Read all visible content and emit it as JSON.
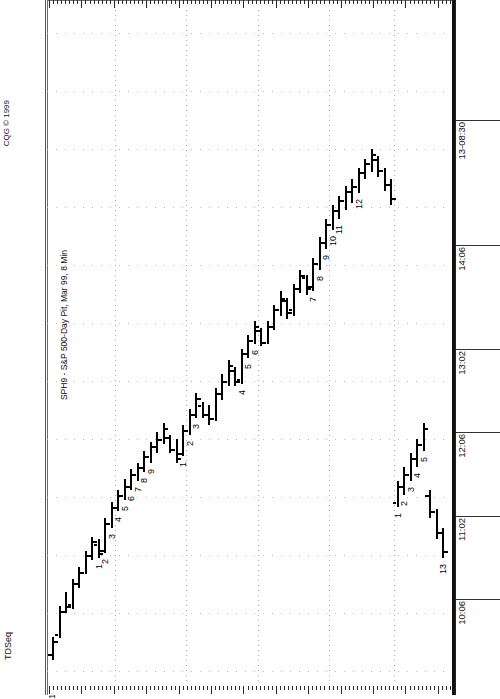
{
  "window": {
    "copyright": "CQG © 1999",
    "study_label": "TDSeq",
    "title": "SPH9 - S&P 500-Day Pit, Mar 99, 8 Min"
  },
  "axes": {
    "price_labels": [
      "126500",
      "126000",
      "125500",
      "125000",
      "124500",
      "124000",
      "123500",
      "123000",
      "122500",
      "122000",
      "121500",
      "121000"
    ],
    "time_labels": [
      "13-08:30",
      "14:06",
      "13:02",
      "12:06",
      "11:02",
      "10:06"
    ]
  },
  "chart_data": {
    "type": "bar",
    "subtype": "ohlc-bar-chart-rotated",
    "title": "SPH9 - S&P 500-Day Pit, Mar 99, 8 Min",
    "study": "TDSeq",
    "copyright": "CQG © 1999",
    "xlabel": "Time",
    "ylabel": "Price",
    "ylim": [
      121000,
      126500
    ],
    "price_ticks": [
      126500,
      126000,
      125500,
      125000,
      124500,
      124000,
      123500,
      123000,
      122500,
      122000,
      121500,
      121000
    ],
    "time_ticks": [
      "10:06",
      "11:02",
      "12:06",
      "13:02",
      "14:06",
      "13-08:30"
    ],
    "grid": true,
    "legend": "none",
    "orientation": "time axis runs left-to-right across screenshot; price axis runs top-to-bottom",
    "annotations": {
      "buy_setup_lower_left": [
        "1",
        "2",
        "3",
        "4",
        "5",
        "6",
        "7",
        "8",
        "9"
      ],
      "sell_setup_midday": [
        "1",
        "2",
        "3",
        "4",
        "5",
        "6",
        "7",
        "8",
        "9",
        "10",
        "11",
        "12"
      ],
      "countdown_next_session": [
        "1",
        "2",
        "3",
        "4",
        "5"
      ],
      "countdown_thirteen": "13"
    },
    "bars": [
      {
        "t": 0,
        "high": 121300,
        "low": 121100,
        "open": 121150,
        "close": 121260
      },
      {
        "t": 1,
        "high": 121560,
        "low": 121290,
        "open": 121320,
        "close": 121520
      },
      {
        "t": 2,
        "high": 121680,
        "low": 121500,
        "open": 121520,
        "close": 121560
      },
      {
        "t": 3,
        "high": 121800,
        "low": 121540,
        "open": 121580,
        "close": 121760
      },
      {
        "t": 4,
        "high": 121900,
        "low": 121720,
        "open": 121760,
        "close": 121860
      },
      {
        "t": 5,
        "high": 122040,
        "low": 121840,
        "open": 121860,
        "close": 122000
      },
      {
        "t": 6,
        "high": 122160,
        "low": 121960,
        "open": 122000,
        "close": 122120
      },
      {
        "t": 7,
        "high": 122140,
        "low": 121980,
        "open": 122100,
        "close": 122020,
        "count": "1"
      },
      {
        "t": 8,
        "high": 122320,
        "low": 122020,
        "open": 122050,
        "close": 122280,
        "count": "2"
      },
      {
        "t": 9,
        "high": 122460,
        "low": 122240,
        "open": 122280,
        "close": 122420,
        "count": "3"
      },
      {
        "t": 10,
        "high": 122560,
        "low": 122380,
        "open": 122420,
        "close": 122520,
        "count": "4"
      },
      {
        "t": 11,
        "high": 122660,
        "low": 122480,
        "open": 122520,
        "close": 122600,
        "count": "5"
      },
      {
        "t": 12,
        "high": 122740,
        "low": 122560,
        "open": 122600,
        "close": 122700,
        "count": "6"
      },
      {
        "t": 13,
        "high": 122800,
        "low": 122640,
        "open": 122700,
        "close": 122760,
        "count": "7"
      },
      {
        "t": 14,
        "high": 122900,
        "low": 122720,
        "open": 122760,
        "close": 122860,
        "count": "8"
      },
      {
        "t": 15,
        "high": 122980,
        "low": 122800,
        "open": 122860,
        "close": 122940,
        "count": "9"
      },
      {
        "t": 16,
        "high": 123060,
        "low": 122880,
        "open": 122940,
        "close": 123000
      },
      {
        "t": 17,
        "high": 123140,
        "low": 122960,
        "open": 123000,
        "close": 123100
      },
      {
        "t": 18,
        "high": 123040,
        "low": 122880,
        "open": 123020,
        "close": 122920
      },
      {
        "t": 19,
        "high": 123000,
        "low": 122800,
        "open": 122920,
        "close": 122840
      },
      {
        "t": 20,
        "high": 123120,
        "low": 122860,
        "open": 122880,
        "close": 123080,
        "count": "1"
      },
      {
        "t": 21,
        "high": 123260,
        "low": 123040,
        "open": 123080,
        "close": 123220,
        "count": "2"
      },
      {
        "t": 22,
        "high": 123400,
        "low": 123180,
        "open": 123220,
        "close": 123360,
        "count": "3"
      },
      {
        "t": 23,
        "high": 123320,
        "low": 123180,
        "open": 123300,
        "close": 123220
      },
      {
        "t": 24,
        "high": 123300,
        "low": 123120,
        "open": 123220,
        "close": 123180
      },
      {
        "t": 25,
        "high": 123440,
        "low": 123160,
        "open": 123180,
        "close": 123400
      },
      {
        "t": 26,
        "high": 123560,
        "low": 123340,
        "open": 123400,
        "close": 123500
      },
      {
        "t": 27,
        "high": 123680,
        "low": 123460,
        "open": 123500,
        "close": 123640
      },
      {
        "t": 28,
        "high": 123620,
        "low": 123460,
        "open": 123600,
        "close": 123500
      },
      {
        "t": 29,
        "high": 123780,
        "low": 123480,
        "open": 123520,
        "close": 123740,
        "count": "4"
      },
      {
        "t": 30,
        "high": 123900,
        "low": 123700,
        "open": 123740,
        "close": 123860,
        "count": "5"
      },
      {
        "t": 31,
        "high": 124020,
        "low": 123820,
        "open": 123860,
        "close": 123980,
        "count": "6"
      },
      {
        "t": 32,
        "high": 123960,
        "low": 123800,
        "open": 123940,
        "close": 123840
      },
      {
        "t": 33,
        "high": 124020,
        "low": 123820,
        "open": 123840,
        "close": 123980
      },
      {
        "t": 34,
        "high": 124160,
        "low": 123940,
        "open": 123980,
        "close": 124120
      },
      {
        "t": 35,
        "high": 124280,
        "low": 124060,
        "open": 124120,
        "close": 124220
      },
      {
        "t": 36,
        "high": 124220,
        "low": 124040,
        "open": 124200,
        "close": 124100
      },
      {
        "t": 37,
        "high": 124340,
        "low": 124060,
        "open": 124120,
        "close": 124300
      },
      {
        "t": 38,
        "high": 124460,
        "low": 124260,
        "open": 124300,
        "close": 124420
      },
      {
        "t": 39,
        "high": 124420,
        "low": 124240,
        "open": 124400,
        "close": 124300
      },
      {
        "t": 40,
        "high": 124560,
        "low": 124280,
        "open": 124320,
        "close": 124520,
        "count": "7"
      },
      {
        "t": 41,
        "high": 124740,
        "low": 124460,
        "open": 124520,
        "close": 124700,
        "count": "8"
      },
      {
        "t": 42,
        "high": 124900,
        "low": 124640,
        "open": 124700,
        "close": 124860,
        "count": "9"
      },
      {
        "t": 43,
        "high": 125020,
        "low": 124800,
        "open": 124860,
        "close": 124980,
        "count": "10"
      },
      {
        "t": 44,
        "high": 125100,
        "low": 124900,
        "open": 124980,
        "close": 125060,
        "count": "11"
      },
      {
        "t": 45,
        "high": 125180,
        "low": 124980,
        "open": 125060,
        "close": 125140
      },
      {
        "t": 46,
        "high": 125240,
        "low": 125040,
        "open": 125140,
        "close": 125180
      },
      {
        "t": 47,
        "high": 125340,
        "low": 125120,
        "open": 125180,
        "close": 125300,
        "count": "12"
      },
      {
        "t": 48,
        "high": 125420,
        "low": 125240,
        "open": 125300,
        "close": 125380
      },
      {
        "t": 49,
        "high": 125500,
        "low": 125300,
        "open": 125380,
        "close": 125460
      },
      {
        "t": 50,
        "high": 125440,
        "low": 125260,
        "open": 125420,
        "close": 125320
      },
      {
        "t": 51,
        "high": 125340,
        "low": 125140,
        "open": 125320,
        "close": 125200
      },
      {
        "t": 52,
        "high": 125240,
        "low": 125020,
        "open": 125200,
        "close": 125080
      },
      {
        "t": 53,
        "high": 122640,
        "low": 122420,
        "open": 122460,
        "close": 122600,
        "count": "1"
      },
      {
        "t": 54,
        "high": 122760,
        "low": 122520,
        "open": 122600,
        "close": 122700,
        "count": "2"
      },
      {
        "t": 55,
        "high": 122880,
        "low": 122640,
        "open": 122700,
        "close": 122840,
        "count": "3"
      },
      {
        "t": 56,
        "high": 123000,
        "low": 122760,
        "open": 122840,
        "close": 122960,
        "count": "4"
      },
      {
        "t": 57,
        "high": 123140,
        "low": 122900,
        "open": 122960,
        "close": 123100,
        "count": "5"
      },
      {
        "t": 58,
        "high": 122560,
        "low": 122320,
        "open": 122520,
        "close": 122380
      },
      {
        "t": 59,
        "high": 122400,
        "low": 122140,
        "open": 122380,
        "close": 122200
      },
      {
        "t": 60,
        "high": 122240,
        "low": 121980,
        "open": 122200,
        "close": 122040,
        "count": "13"
      }
    ]
  }
}
